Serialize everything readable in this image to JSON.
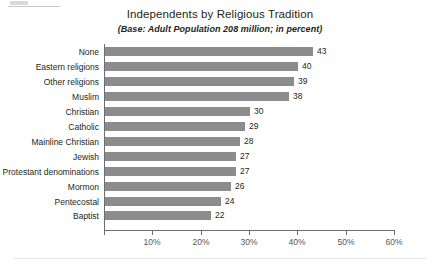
{
  "chart_data": {
    "type": "bar",
    "orientation": "horizontal",
    "title": "Independents by Religious Tradition",
    "subtitle": "(Base: Adult Population 208 million; in percent)",
    "xlabel": "",
    "ylabel": "",
    "xlim": [
      0,
      60
    ],
    "xtick_labels": [
      "10%",
      "20%",
      "30%",
      "40%",
      "50%",
      "60%"
    ],
    "xtick_values": [
      10,
      20,
      30,
      40,
      50,
      60
    ],
    "grid": "vertical-white-gridlines",
    "legend": "none",
    "bar_color": "#8c8c8c",
    "value_label_suffix": "",
    "categories": [
      "None",
      "Eastern religions",
      "Other religions",
      "Muslim",
      "Christian",
      "Catholic",
      "Mainline Christian",
      "Jewish",
      "Protestant denominations",
      "Mormon",
      "Pentecostal",
      "Baptist"
    ],
    "values": [
      43,
      40,
      39,
      38,
      30,
      29,
      28,
      27,
      27,
      26,
      24,
      22
    ],
    "value_labels": [
      "43",
      "40",
      "39",
      "38",
      "30",
      "29",
      "28",
      "27",
      "27",
      "26",
      "24",
      "22"
    ]
  },
  "colors": {
    "bar": "#8c8c8c",
    "axis": "#6d6e71",
    "text": "#231f20",
    "tick_text": "#58595b",
    "gridline": "#ffffff",
    "background": "#ffffff"
  }
}
